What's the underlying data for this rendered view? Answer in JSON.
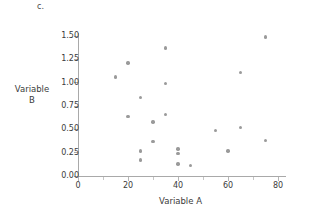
{
  "panel": {
    "label": "c."
  },
  "chart_data": {
    "type": "scatter",
    "title": "c.",
    "xlabel": "Variable A",
    "ylabel": "Variable B",
    "xlim": [
      0,
      83
    ],
    "ylim": [
      0.0,
      1.58
    ],
    "grid": false,
    "legend": null,
    "marker_color": "#9a9a9a",
    "axis_color": "#a9a9a9",
    "xticks": [
      0,
      20,
      40,
      60,
      80
    ],
    "xtick_labels": [
      "0",
      "20",
      "40",
      "60",
      "80"
    ],
    "xminor_ticks": [
      10,
      30,
      50,
      70
    ],
    "yticks": [
      0.0,
      0.25,
      0.5,
      0.75,
      1.0,
      1.25,
      1.5
    ],
    "ytick_labels": [
      "0.00",
      "0.25",
      "0.50",
      "0.75",
      "1.00",
      "1.25",
      "1.50"
    ],
    "points": [
      {
        "x": 15,
        "y": 1.06
      },
      {
        "x": 20,
        "y": 1.21
      },
      {
        "x": 20,
        "y": 0.64
      },
      {
        "x": 25,
        "y": 0.84
      },
      {
        "x": 25,
        "y": 0.27
      },
      {
        "x": 25,
        "y": 0.17
      },
      {
        "x": 30,
        "y": 0.58
      },
      {
        "x": 30,
        "y": 0.37
      },
      {
        "x": 35,
        "y": 1.37
      },
      {
        "x": 35,
        "y": 0.99
      },
      {
        "x": 35,
        "y": 0.66
      },
      {
        "x": 40,
        "y": 0.29
      },
      {
        "x": 40,
        "y": 0.24
      },
      {
        "x": 40,
        "y": 0.13
      },
      {
        "x": 45,
        "y": 0.11
      },
      {
        "x": 55,
        "y": 0.49
      },
      {
        "x": 60,
        "y": 0.27
      },
      {
        "x": 65,
        "y": 1.11
      },
      {
        "x": 65,
        "y": 0.52
      },
      {
        "x": 75,
        "y": 1.49
      },
      {
        "x": 75,
        "y": 0.38
      }
    ]
  }
}
